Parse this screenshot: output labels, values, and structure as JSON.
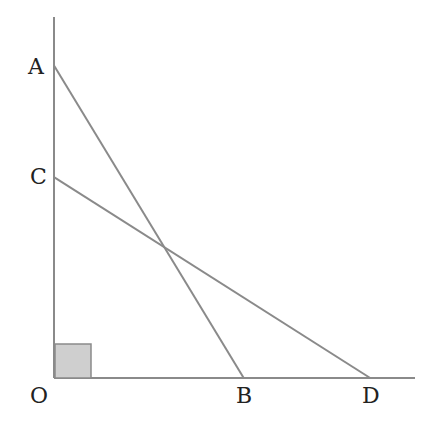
{
  "diagram": {
    "points": {
      "O": {
        "label": "O",
        "x": 0,
        "y": 0
      },
      "A": {
        "label": "A",
        "x": 0,
        "y": 8.4
      },
      "C": {
        "label": "C",
        "x": 0,
        "y": 5.4
      },
      "B": {
        "label": "B",
        "x": 5.1,
        "y": 0
      },
      "D": {
        "label": "D",
        "x": 8.5,
        "y": 0
      }
    },
    "segments": [
      {
        "from": "A",
        "to": "B"
      },
      {
        "from": "C",
        "to": "D"
      }
    ],
    "right_angle_at": "O",
    "colors": {
      "line": "#8a8a8a",
      "right_angle_fill": "#cfcfcf",
      "label": "#222222"
    }
  }
}
